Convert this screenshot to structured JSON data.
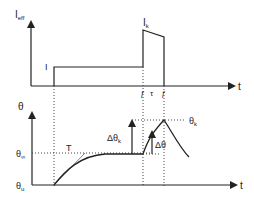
{
  "colors": {
    "line": "#222222",
    "dotted": "#444444",
    "background": "#ffffff"
  },
  "top_plot": {
    "y_axis_label": "I",
    "y_axis_sub": "eff",
    "x_axis_label": "t",
    "step_label": "I",
    "pulse_label": "I",
    "pulse_sub": "k",
    "tau_label": "τ",
    "break_mark": "ƒ"
  },
  "bottom_plot": {
    "y_axis_label": "θ",
    "x_axis_label": "t",
    "theta_inf": "θ",
    "theta_inf_sub": "∞",
    "theta_u": "θ",
    "theta_u_sub": "u",
    "theta_k": "θ",
    "theta_k_sub": "k",
    "time_const": "T",
    "delta_theta_k": "Δθ",
    "delta_theta_k_sub": "k",
    "delta_theta": "Δθ"
  }
}
